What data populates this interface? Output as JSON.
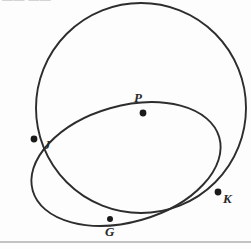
{
  "figure": {
    "type": "geometry-diagram",
    "background_color": "#fdfdfd",
    "stroke_color": "#2d2d2d",
    "dot_color": "#1a1a1a",
    "label_color": "#2a2a2a",
    "rule_color": "#8a8a8a",
    "clipped_header_text": "—— ——",
    "ghost_watermark": "",
    "points": [
      {
        "id": "J",
        "label": "J",
        "x": 34,
        "y": 139,
        "dot_radius": 3.4
      },
      {
        "id": "P",
        "label": "P",
        "x": 143,
        "y": 113,
        "dot_radius": 3.4
      },
      {
        "id": "K",
        "label": "K",
        "x": 218,
        "y": 192,
        "dot_radius": 3.4
      },
      {
        "id": "G",
        "label": "G",
        "x": 110,
        "y": 219,
        "dot_radius": 3.0
      }
    ],
    "shapes": [
      {
        "id": "large-circle",
        "name": "large-circle",
        "kind": "circle",
        "cx": 141,
        "cy": 108,
        "r": 105,
        "rotation": 0
      },
      {
        "id": "small-circle",
        "name": "small-circle",
        "kind": "ellipse",
        "cx": 126,
        "cy": 164,
        "rx": 97,
        "ry": 58,
        "rotation": -16
      }
    ],
    "bottom_rule": {
      "y": 242,
      "x1": 0,
      "x2": 251
    }
  }
}
